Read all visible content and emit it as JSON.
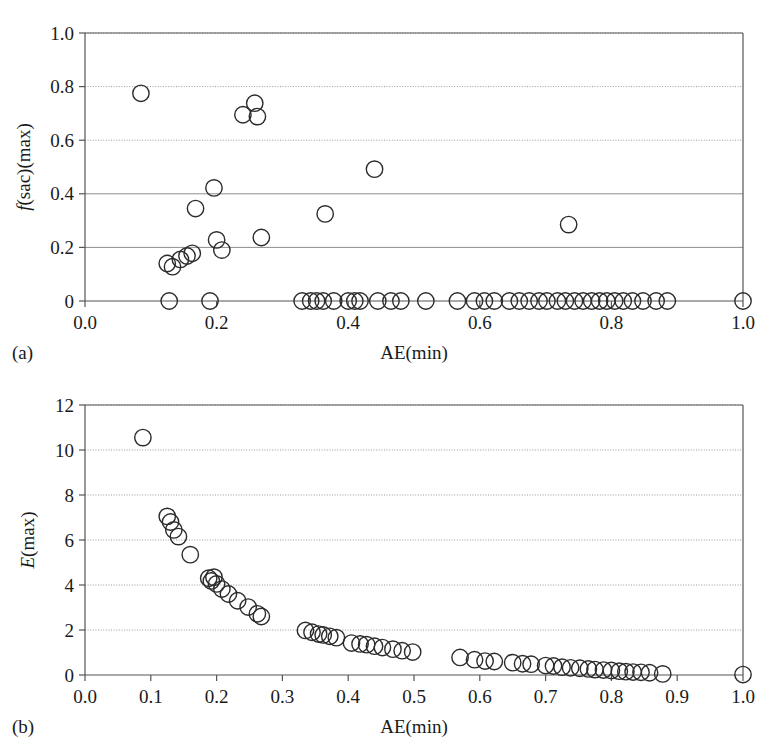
{
  "figure": {
    "background_color": "#ffffff",
    "marker_stroke_color": "#2b2b2b",
    "axis_color": "#555555",
    "grid_color": "#9a9a9a"
  },
  "panels": [
    {
      "tag": "(a)",
      "chart_data": {
        "type": "scatter",
        "title": "",
        "xlabel": "AE(min)",
        "ylabel": "f(sac)(max)",
        "ylabel_italic_prefix": "f",
        "ylabel_rest": "(sac)(max)",
        "xlim": [
          0.0,
          1.0
        ],
        "ylim": [
          0.0,
          1.0
        ],
        "xticks": [
          0.0,
          0.2,
          0.4,
          0.6,
          0.8,
          1.0
        ],
        "xticklabels": [
          "0.0",
          "0.2",
          "0.4",
          "0.6",
          "0.8",
          "1.0"
        ],
        "yticks": [
          0.0,
          0.2,
          0.4,
          0.6,
          0.8,
          1.0
        ],
        "yticklabels": [
          "0",
          "0.2",
          "0.4",
          "0.6",
          "0.8",
          "1.0"
        ],
        "grid": true,
        "legend": "none",
        "series": [
          {
            "name": "f(sac)(max) vs AE(min)",
            "marker": "open-circle",
            "points": [
              [
                0.085,
                0.775
              ],
              [
                0.125,
                0.14
              ],
              [
                0.133,
                0.128
              ],
              [
                0.145,
                0.155
              ],
              [
                0.155,
                0.168
              ],
              [
                0.163,
                0.178
              ],
              [
                0.168,
                0.345
              ],
              [
                0.196,
                0.422
              ],
              [
                0.2,
                0.228
              ],
              [
                0.208,
                0.19
              ],
              [
                0.24,
                0.695
              ],
              [
                0.258,
                0.738
              ],
              [
                0.262,
                0.688
              ],
              [
                0.268,
                0.237
              ],
              [
                0.365,
                0.325
              ],
              [
                0.44,
                0.492
              ],
              [
                0.735,
                0.285
              ],
              [
                0.128,
                0.0
              ],
              [
                0.19,
                0.0
              ],
              [
                0.33,
                0.0
              ],
              [
                0.343,
                0.0
              ],
              [
                0.352,
                0.0
              ],
              [
                0.362,
                0.0
              ],
              [
                0.378,
                0.0
              ],
              [
                0.4,
                0.0
              ],
              [
                0.41,
                0.0
              ],
              [
                0.418,
                0.0
              ],
              [
                0.445,
                0.0
              ],
              [
                0.465,
                0.0
              ],
              [
                0.48,
                0.0
              ],
              [
                0.518,
                0.0
              ],
              [
                0.566,
                0.0
              ],
              [
                0.592,
                0.0
              ],
              [
                0.607,
                0.0
              ],
              [
                0.622,
                0.0
              ],
              [
                0.645,
                0.0
              ],
              [
                0.66,
                0.0
              ],
              [
                0.675,
                0.0
              ],
              [
                0.69,
                0.0
              ],
              [
                0.702,
                0.0
              ],
              [
                0.718,
                0.0
              ],
              [
                0.73,
                0.0
              ],
              [
                0.744,
                0.0
              ],
              [
                0.757,
                0.0
              ],
              [
                0.77,
                0.0
              ],
              [
                0.782,
                0.0
              ],
              [
                0.793,
                0.0
              ],
              [
                0.805,
                0.0
              ],
              [
                0.818,
                0.0
              ],
              [
                0.832,
                0.0
              ],
              [
                0.848,
                0.0
              ],
              [
                0.868,
                0.0
              ],
              [
                0.885,
                0.0
              ],
              [
                1.0,
                0.0
              ]
            ]
          }
        ]
      }
    },
    {
      "tag": "(b)",
      "chart_data": {
        "type": "scatter",
        "title": "",
        "xlabel": "AE(min)",
        "ylabel": "E(max)",
        "ylabel_italic_prefix": "E",
        "ylabel_rest": "(max)",
        "xlim": [
          0.0,
          1.0
        ],
        "ylim": [
          0,
          12
        ],
        "xticks": [
          0.0,
          0.1,
          0.2,
          0.3,
          0.4,
          0.5,
          0.6,
          0.7,
          0.8,
          0.9,
          1.0
        ],
        "xticklabels": [
          "0.0",
          "0.1",
          "0.2",
          "0.3",
          "0.4",
          "0.5",
          "0.6",
          "0.7",
          "0.8",
          "0.9",
          "1.0"
        ],
        "yticks": [
          0,
          2,
          4,
          6,
          8,
          10,
          12
        ],
        "yticklabels": [
          "0",
          "2",
          "4",
          "6",
          "8",
          "10",
          "12"
        ],
        "grid": true,
        "legend": "none",
        "series": [
          {
            "name": "E(max) vs AE(min)",
            "marker": "open-circle",
            "points": [
              [
                0.088,
                10.55
              ],
              [
                0.125,
                7.05
              ],
              [
                0.13,
                6.8
              ],
              [
                0.135,
                6.45
              ],
              [
                0.142,
                6.15
              ],
              [
                0.16,
                5.35
              ],
              [
                0.188,
                4.3
              ],
              [
                0.192,
                4.18
              ],
              [
                0.196,
                4.35
              ],
              [
                0.2,
                4.05
              ],
              [
                0.208,
                3.82
              ],
              [
                0.218,
                3.6
              ],
              [
                0.232,
                3.3
              ],
              [
                0.248,
                3.02
              ],
              [
                0.262,
                2.72
              ],
              [
                0.268,
                2.6
              ],
              [
                0.335,
                1.98
              ],
              [
                0.345,
                1.9
              ],
              [
                0.355,
                1.82
              ],
              [
                0.362,
                1.78
              ],
              [
                0.372,
                1.72
              ],
              [
                0.382,
                1.66
              ],
              [
                0.405,
                1.42
              ],
              [
                0.418,
                1.38
              ],
              [
                0.428,
                1.35
              ],
              [
                0.44,
                1.28
              ],
              [
                0.452,
                1.22
              ],
              [
                0.468,
                1.15
              ],
              [
                0.482,
                1.08
              ],
              [
                0.498,
                1.02
              ],
              [
                0.57,
                0.78
              ],
              [
                0.592,
                0.68
              ],
              [
                0.608,
                0.62
              ],
              [
                0.622,
                0.6
              ],
              [
                0.65,
                0.55
              ],
              [
                0.665,
                0.5
              ],
              [
                0.678,
                0.48
              ],
              [
                0.7,
                0.42
              ],
              [
                0.712,
                0.4
              ],
              [
                0.725,
                0.35
              ],
              [
                0.738,
                0.32
              ],
              [
                0.752,
                0.3
              ],
              [
                0.765,
                0.27
              ],
              [
                0.775,
                0.24
              ],
              [
                0.788,
                0.22
              ],
              [
                0.8,
                0.2
              ],
              [
                0.812,
                0.17
              ],
              [
                0.822,
                0.15
              ],
              [
                0.833,
                0.13
              ],
              [
                0.845,
                0.12
              ],
              [
                0.858,
                0.1
              ],
              [
                0.878,
                0.05
              ],
              [
                1.0,
                0.02
              ]
            ]
          }
        ]
      }
    }
  ]
}
